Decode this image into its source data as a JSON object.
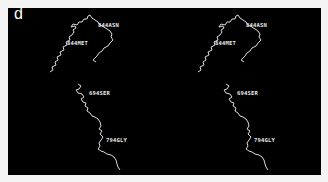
{
  "figure": {
    "panel_label": "d",
    "background_color": "#000000",
    "trace_color": "#dcdcdc",
    "views": [
      {
        "name": "left",
        "labels": [
          "844ASN",
          "844MET",
          "694SER",
          "794GLY"
        ]
      },
      {
        "name": "right",
        "labels": [
          "844ASN",
          "844MET",
          "694SER",
          "794GLY"
        ]
      }
    ]
  }
}
